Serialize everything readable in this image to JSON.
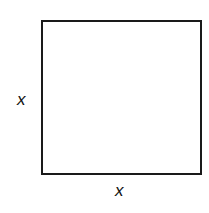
{
  "diagram": {
    "shape": "square",
    "colors": {
      "stroke": "#1a1a1a",
      "fill": "#ffffff",
      "text": "#111111"
    },
    "labels": {
      "left_side": "x",
      "bottom_side": "x"
    }
  }
}
